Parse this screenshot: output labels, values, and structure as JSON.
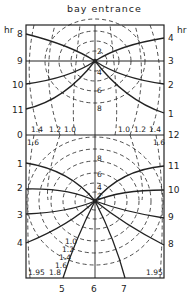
{
  "title": "bay entrance",
  "left_axis": {
    "unit": "hr",
    "labels": [
      "8",
      "9",
      "10",
      "11",
      "0",
      "1",
      "2",
      "3",
      "4"
    ]
  },
  "right_axis": {
    "unit": "hr",
    "labels": [
      "4",
      "3",
      "2",
      "1",
      "12",
      "11",
      "10",
      "9",
      "8"
    ]
  },
  "bottom_axis": {
    "labels": [
      "5",
      "6",
      "7"
    ]
  },
  "upper_amphidrome_range_labels": [
    "2",
    "4",
    "6",
    "8"
  ],
  "lower_amphidrome_range_labels": [
    "8",
    "6",
    "4",
    "2"
  ],
  "mid_labels_left": [
    "1.4",
    "1.2",
    "1.0",
    "1.6"
  ],
  "mid_labels_right": [
    "1.0",
    "1.2",
    "1.4",
    "1.6"
  ],
  "bottom_range_labels": [
    "1.0",
    "1.2",
    "1.4",
    "1.6",
    "1.8",
    "1.95"
  ],
  "bottom_right_label": "1.95",
  "colors": {
    "line": "#222222",
    "background": "#ffffff"
  }
}
